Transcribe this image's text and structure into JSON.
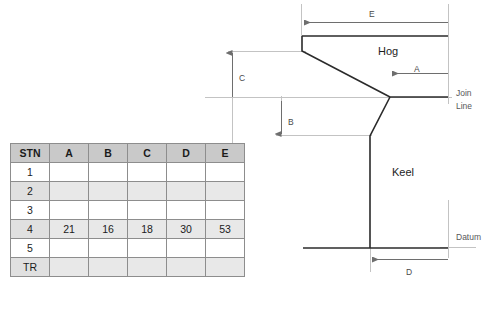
{
  "diagram": {
    "part_labels": [
      {
        "name": "hog-label",
        "text": "Hog",
        "x": 378,
        "y": 45
      },
      {
        "name": "keel-label",
        "text": "Keel",
        "x": 392,
        "y": 166
      }
    ],
    "dimension_labels": [
      {
        "name": "dimension-e-label",
        "text": "E",
        "x": 369,
        "y": 9
      },
      {
        "name": "dimension-a-label",
        "text": "A",
        "x": 414,
        "y": 64
      },
      {
        "name": "dimension-c-label",
        "text": "C",
        "x": 239,
        "y": 73
      },
      {
        "name": "dimension-b-label",
        "text": "B",
        "x": 288,
        "y": 117
      },
      {
        "name": "dimension-d-label",
        "text": "D",
        "x": 406,
        "y": 267
      }
    ],
    "reference_labels": [
      {
        "name": "join-line-label-1",
        "text": "Join",
        "x": 456,
        "y": 88
      },
      {
        "name": "join-line-label-2",
        "text": "Line",
        "x": 456,
        "y": 101
      },
      {
        "name": "datum-label",
        "text": "Datum",
        "x": 456,
        "y": 232
      }
    ],
    "colors": {
      "outline": "#2b2b2b",
      "dimension": "#6e6e6e",
      "reference": "#b9b9b9",
      "text": "#2b2b2b"
    }
  },
  "table": {
    "name": "offsets-table",
    "columns": [
      "STN",
      "A",
      "B",
      "C",
      "D",
      "E"
    ],
    "rows": [
      {
        "stn": "1",
        "shaded": false,
        "values": [
          "",
          "",
          "",
          "",
          ""
        ]
      },
      {
        "stn": "2",
        "shaded": true,
        "values": [
          "",
          "",
          "",
          "",
          ""
        ]
      },
      {
        "stn": "3",
        "shaded": false,
        "values": [
          "",
          "",
          "",
          "",
          ""
        ]
      },
      {
        "stn": "4",
        "shaded": true,
        "values": [
          "21",
          "16",
          "18",
          "30",
          "53"
        ]
      },
      {
        "stn": "5",
        "shaded": false,
        "values": [
          "",
          "",
          "",
          "",
          ""
        ]
      },
      {
        "stn": "TR",
        "shaded": true,
        "values": [
          "",
          "",
          "",
          "",
          ""
        ]
      }
    ]
  }
}
